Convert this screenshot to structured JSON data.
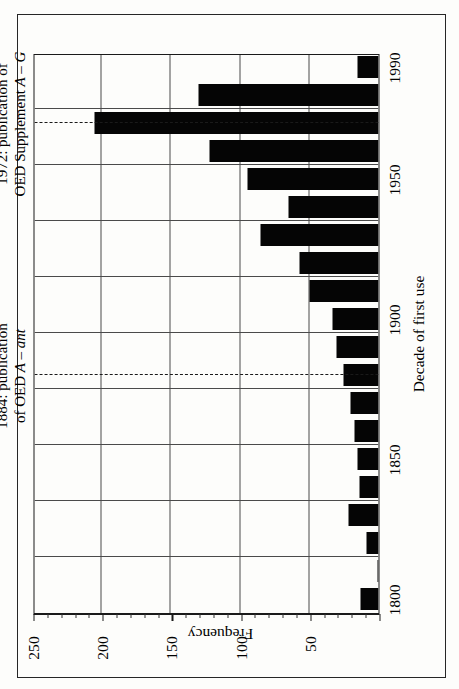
{
  "chart_data": {
    "type": "bar",
    "orientation": "rotated-90",
    "title": "",
    "xlabel": "Decade of first use",
    "ylabel": "Frequency",
    "ylim": [
      0,
      250
    ],
    "yticks": [
      0,
      50,
      100,
      150,
      200,
      250
    ],
    "ytick_labels": [
      "",
      "50",
      "100",
      "150",
      "200",
      "250"
    ],
    "xticks": [
      1800,
      1850,
      1900,
      1950,
      1990
    ],
    "xtick_labels": [
      "1800",
      "1850",
      "1900",
      "1950",
      "1990"
    ],
    "grid": true,
    "categories": [
      1800,
      1810,
      1820,
      1830,
      1840,
      1850,
      1860,
      1870,
      1880,
      1890,
      1900,
      1910,
      1920,
      1930,
      1940,
      1950,
      1960,
      1970,
      1980,
      1990
    ],
    "category_labels": [
      "1800",
      "1810",
      "1820",
      "1830",
      "1840",
      "1850",
      "1860",
      "1870",
      "1880",
      "1890",
      "1900",
      "1910",
      "1920",
      "1930",
      "1940",
      "1950",
      "1960",
      "1970",
      "1980",
      "1990"
    ],
    "values": [
      13,
      1,
      9,
      22,
      14,
      15,
      17,
      20,
      25,
      30,
      33,
      50,
      57,
      85,
      65,
      95,
      122,
      205,
      130,
      15
    ],
    "annotations": [
      {
        "name": "oed-1884",
        "at_category": 1880,
        "line1": "1884: publication",
        "line2_prefix": "of OED ",
        "line2_italic": "A – ant",
        "style": "dashed"
      },
      {
        "name": "oed-supplement-1972",
        "at_category": 1970,
        "line1": "1972: publication of",
        "line2_prefix": "OED Supplement ",
        "line2_italic": "A – G",
        "style": "dashed"
      }
    ]
  },
  "axes": {
    "value_axis_title": "Frequency",
    "category_axis_title": "Decade of first use"
  },
  "colors": {
    "bar": "#050505",
    "grid": "#4a4a4a",
    "axis": "#1a1a1a",
    "background": "#fdfdfb",
    "frame": "#262626"
  }
}
